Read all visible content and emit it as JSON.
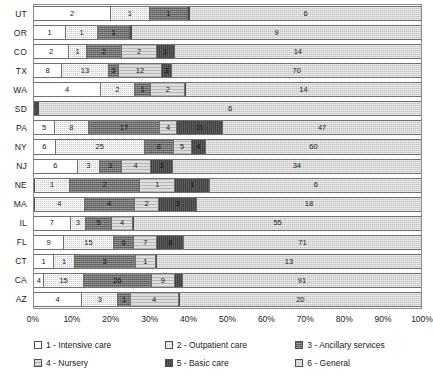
{
  "chart_data": {
    "type": "bar",
    "orientation": "horizontal",
    "stacked": true,
    "normalized": true,
    "title": "",
    "xlabel": "",
    "ylabel": "",
    "xlim": [
      0,
      100
    ],
    "grid": false,
    "legend_position": "bottom",
    "categories": [
      "UT",
      "OR",
      "CO",
      "TX",
      "WA",
      "SD",
      "PA",
      "NY",
      "NJ",
      "NE",
      "MA",
      "IL",
      "FL",
      "CT",
      "CA",
      "AZ"
    ],
    "xtick_labels": [
      "0%",
      "10%",
      "20%",
      "30%",
      "40%",
      "50%",
      "60%",
      "70%",
      "80%",
      "90%",
      "100%"
    ],
    "xtick_values": [
      0,
      10,
      20,
      30,
      40,
      50,
      60,
      70,
      80,
      90,
      100
    ],
    "series": [
      {
        "name": "1 - Intensive care",
        "key": "s1",
        "values": [
          2,
          1,
          2,
          8,
          4,
          0,
          5,
          6,
          6,
          0,
          0,
          7,
          9,
          1,
          4,
          4
        ]
      },
      {
        "name": "2 - Outpatient care",
        "key": "s2",
        "values": [
          1,
          1,
          1,
          13,
          2,
          0,
          8,
          25,
          3,
          1,
          4,
          3,
          15,
          1,
          15,
          3
        ]
      },
      {
        "name": "3 - Ancillary services",
        "key": "s3",
        "values": [
          1,
          1,
          2,
          3,
          1,
          0,
          17,
          8,
          3,
          2,
          4,
          5,
          6,
          3,
          26,
          1
        ]
      },
      {
        "name": "4 - Nursery",
        "key": "s4",
        "values": [
          0,
          0,
          2,
          12,
          2,
          0,
          4,
          5,
          4,
          1,
          2,
          4,
          7,
          1,
          9,
          4
        ]
      },
      {
        "name": "5 - Basic care",
        "key": "s5",
        "values": [
          0,
          0,
          1,
          3,
          0,
          0,
          11,
          4,
          3,
          1,
          3,
          0,
          8,
          0,
          3,
          0
        ]
      },
      {
        "name": "6 - General",
        "key": "s6",
        "values": [
          6,
          9,
          14,
          70,
          14,
          6,
          47,
          60,
          34,
          6,
          18,
          55,
          71,
          13,
          91,
          20
        ]
      }
    ],
    "legend_entries": [
      {
        "label": "1 - Intensive care",
        "key": "s1"
      },
      {
        "label": "2 - Outpatient care",
        "key": "s2"
      },
      {
        "label": "3 - Ancillary services",
        "key": "s3"
      },
      {
        "label": "4 - Nursery",
        "key": "s4"
      },
      {
        "label": "5 - Basic care",
        "key": "s5"
      },
      {
        "label": "6 - General",
        "key": "s6"
      }
    ]
  }
}
